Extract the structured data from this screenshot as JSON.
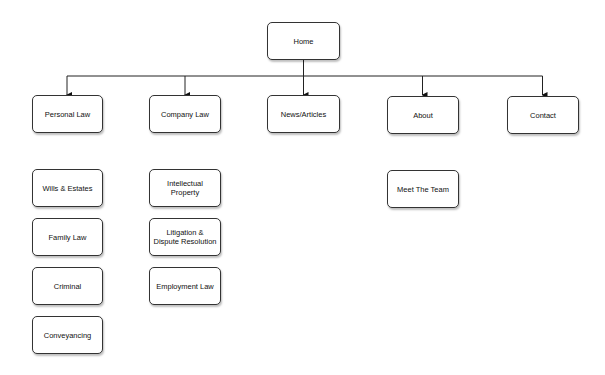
{
  "diagram": {
    "root": {
      "label": "Home"
    },
    "level1": [
      {
        "label": "Personal Law"
      },
      {
        "label": "Company Law"
      },
      {
        "label": "News/Articles"
      },
      {
        "label": "About"
      },
      {
        "label": "Contact"
      }
    ],
    "personal_law_children": [
      {
        "label": "Wills & Estates"
      },
      {
        "label": "Family Law"
      },
      {
        "label": "Criminal"
      },
      {
        "label": "Conveyancing"
      }
    ],
    "company_law_children": [
      {
        "label": "Intellectual Property"
      },
      {
        "label": "Litigation & Dispute Resolution"
      },
      {
        "label": "Employment Law"
      }
    ],
    "about_children": [
      {
        "label": "Meet The Team"
      }
    ],
    "colors": {
      "stroke": "#333333",
      "fill": "#ffffff",
      "text": "#111111"
    }
  }
}
